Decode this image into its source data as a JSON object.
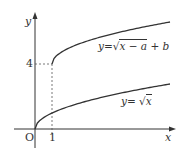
{
  "axes": {
    "x_label": "x",
    "y_label": "y",
    "origin_label": "O"
  },
  "ticks": {
    "x_tick": "1",
    "y_tick": "4"
  },
  "curves": [
    {
      "name": "shifted-sqrt",
      "label": "y=√x − a + b",
      "label_parts": {
        "prefix": "y=",
        "radicand": "x − a",
        "suffix": " + b"
      }
    },
    {
      "name": "sqrt",
      "label": "y= √x",
      "label_parts": {
        "prefix": "y= ",
        "radicand": "x"
      }
    }
  ],
  "colors": {
    "curve": "#333333",
    "axis": "#333333",
    "dashed": "#555555"
  }
}
